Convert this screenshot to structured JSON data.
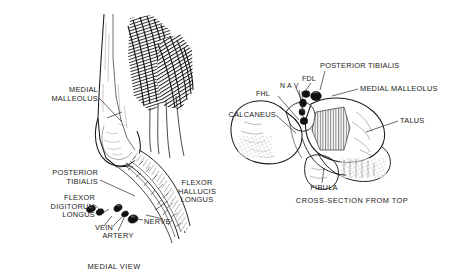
{
  "figure": {
    "background": "#ffffff",
    "ink": "#1a1a1a",
    "panels": [
      {
        "id": "medial-view",
        "caption": "MEDIAL VIEW"
      },
      {
        "id": "cross-section",
        "caption": "CROSS-SECTION FROM TOP"
      }
    ]
  },
  "medial_view": {
    "caption": "MEDIAL VIEW",
    "labels": {
      "medial_malleolus": "MEDIAL\nMALLEOLUS",
      "posterior_tibialis": "POSTERIOR\nTIBIALIS",
      "flexor_digitorum_longus": "FLEXOR\nDIGITORUM\nLONGUS",
      "vein": "VEIN",
      "artery": "ARTERY",
      "nerve": "NERVE",
      "flexor_hallucis_longus": "FLEXOR\nHALLUCIS\nLONGUS"
    }
  },
  "cross_section": {
    "caption": "CROSS-SECTION FROM TOP",
    "labels": {
      "posterior_tibialis": "POSTERIOR TIBIALIS",
      "fdl": "FDL",
      "nav": "N A V",
      "fhl": "FHL",
      "medial_malleolus": "MEDIAL MALLEOLUS",
      "calcaneus": "CALCANEUS",
      "talus": "TALUS",
      "fibula": "FIBULA"
    }
  }
}
